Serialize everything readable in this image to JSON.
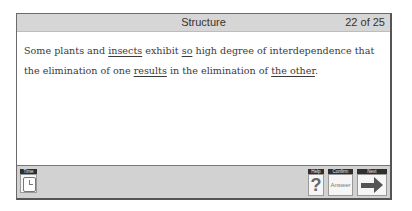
{
  "header": {
    "title": "Structure",
    "counter": "22 of 25"
  },
  "question": {
    "segments": [
      {
        "text": "Some plants and ",
        "underline": false
      },
      {
        "text": "insects",
        "underline": true
      },
      {
        "text": " exhibit ",
        "underline": false
      },
      {
        "text": "so",
        "underline": true
      },
      {
        "text": " high degree of interdependence that the elimination of one ",
        "underline": false
      },
      {
        "text": "results",
        "underline": true
      },
      {
        "text": " in the elimination of ",
        "underline": false
      },
      {
        "text": "the other",
        "underline": true
      },
      {
        "text": ".",
        "underline": false
      }
    ]
  },
  "toolbar": {
    "time_label": "Time",
    "help_label": "Help",
    "help_glyph": "?",
    "confirm_label": "Confirm",
    "confirm_button": "Answer",
    "next_label": "Next"
  }
}
